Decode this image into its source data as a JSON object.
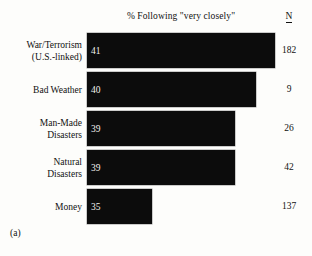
{
  "figure": {
    "panel_caption": "(a)",
    "title": "% Following \"very closely\"",
    "n_column_header": "N",
    "background_color": "#fdfdfb",
    "bar_color": "#0c0c0c",
    "value_label_color": "#f2f2ee",
    "text_color": "#111111"
  },
  "chart_data": {
    "type": "bar",
    "orientation": "horizontal",
    "title": "% Following \"very closely\"",
    "xlabel": "",
    "ylabel": "",
    "grid": false,
    "legend": false,
    "xlim": [
      0,
      45
    ],
    "categories": [
      "War/Terrorism (U.S.-linked)",
      "Bad Weather",
      "Man-Made Disasters",
      "Natural Disasters",
      "Money"
    ],
    "values": [
      41,
      40,
      39,
      39,
      35
    ],
    "value_labels": [
      "41",
      "40",
      "39",
      "39",
      "35"
    ],
    "n_labels": [
      "182",
      "9",
      "26",
      "42",
      "137"
    ],
    "n_values": [
      182,
      9,
      26,
      42,
      137
    ],
    "annotations": [
      "(a)"
    ]
  },
  "rows": [
    {
      "label_lines": [
        "War/Terrorism",
        "(U.S.-linked)"
      ],
      "value": "41",
      "n": "182",
      "top": 33,
      "bar_width": 188
    },
    {
      "label_lines": [
        "Bad Weather"
      ],
      "value": "40",
      "n": "9",
      "top": 72,
      "bar_width": 169
    },
    {
      "label_lines": [
        "Man-Made",
        "Disasters"
      ],
      "value": "39",
      "n": "26",
      "top": 111,
      "bar_width": 148
    },
    {
      "label_lines": [
        "Natural",
        "Disasters"
      ],
      "value": "39",
      "n": "42",
      "top": 150,
      "bar_width": 148
    },
    {
      "label_lines": [
        "Money"
      ],
      "value": "35",
      "n": "137",
      "top": 189,
      "bar_width": 65
    }
  ]
}
